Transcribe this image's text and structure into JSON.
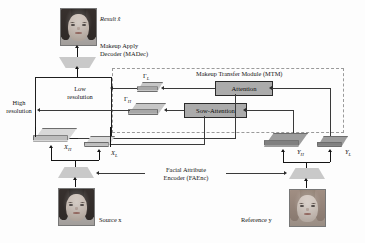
{
  "figure": {
    "type": "architecture-diagram",
    "domain": "makeup transfer neural network"
  },
  "labels": {
    "result": "Result x̂",
    "madec_line1": "Makeup Apply",
    "madec_line2": "Decoder (MADec)",
    "mtm_title": "Makeup Transfer Module (MTM)",
    "low_res_line1": "Low",
    "low_res_line2": "resolution",
    "high_res_line1": "High",
    "high_res_line2": "resolution",
    "faenc_line1": "Facial Attribute",
    "faenc_line2": "Encoder (FAEnc)",
    "source": "Source x",
    "reference": "Reference y"
  },
  "blocks": [
    {
      "id": "attention",
      "label": "Attention",
      "fill": "#ababab"
    },
    {
      "id": "sow-attention",
      "label": "Sow-Attention",
      "fill": "#ababab"
    }
  ],
  "tensors": [
    {
      "id": "gamma-l",
      "symbol": "Γ",
      "subscript": "L",
      "size": "small",
      "tone": "mid"
    },
    {
      "id": "gamma-h",
      "symbol": "Γ",
      "subscript": "H",
      "size": "large",
      "tone": "mid"
    },
    {
      "id": "x-h",
      "symbol": "X",
      "subscript": "H",
      "size": "large",
      "tone": "light"
    },
    {
      "id": "x-l",
      "symbol": "X",
      "subscript": "L",
      "size": "small",
      "tone": "light"
    },
    {
      "id": "y-h",
      "symbol": "Y",
      "subscript": "H",
      "size": "large",
      "tone": "dark"
    },
    {
      "id": "y-l",
      "symbol": "Y",
      "subscript": "L",
      "size": "small",
      "tone": "dark"
    }
  ],
  "images": [
    {
      "id": "result-image",
      "caption": "Result x̂",
      "subject": "woman frontal portrait"
    },
    {
      "id": "source-image",
      "caption": "Source x",
      "subject": "woman frontal portrait"
    },
    {
      "id": "reference-image",
      "caption": "Reference y",
      "subject": "woman with heavy makeup"
    }
  ],
  "symbols": {
    "gamma_l_main": "Γ",
    "gamma_l_sub": "L",
    "gamma_h_main": "Γ",
    "gamma_h_sub": "H",
    "x_h_main": "X",
    "x_h_sub": "H",
    "x_l_main": "X",
    "x_l_sub": "L",
    "y_h_main": "Y",
    "y_h_sub": "H",
    "y_l_main": "Y",
    "y_l_sub": "L"
  },
  "colors": {
    "block_fill": "#ababab",
    "slab_light": "#d8d8d8",
    "slab_mid": "#c6c6c6",
    "slab_dark": "#9d9d9d",
    "trapezoid": "#c9c9c9",
    "line": "#3a3a3a",
    "mtm_border": "#9a9a9a"
  }
}
